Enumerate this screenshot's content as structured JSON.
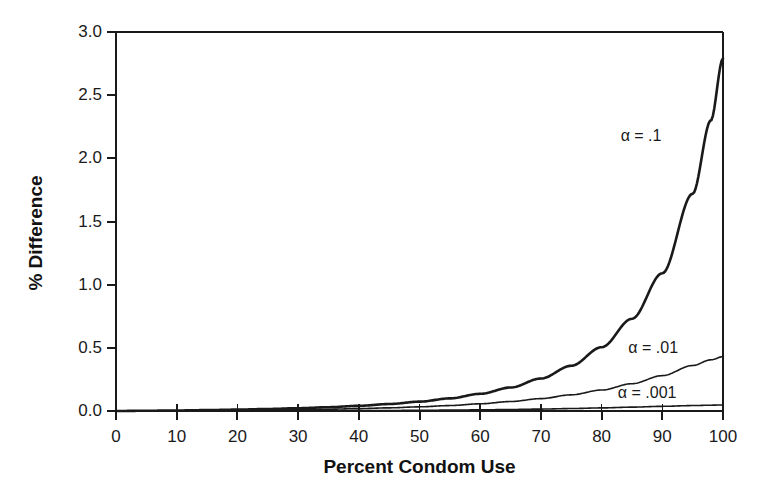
{
  "chart_data": {
    "type": "line",
    "title": "",
    "xlabel": "Percent Condom Use",
    "ylabel": "% Difference",
    "xlim": [
      0,
      100
    ],
    "ylim": [
      0,
      3.0
    ],
    "grid": false,
    "legend_position": "inline-annotations",
    "xticks": [
      "0",
      "10",
      "20",
      "30",
      "40",
      "50",
      "60",
      "70",
      "80",
      "90",
      "100"
    ],
    "xtick_values": [
      0,
      10,
      20,
      30,
      40,
      50,
      60,
      70,
      80,
      90,
      100
    ],
    "yticks": [
      "0.0",
      "0.5",
      "1.0",
      "1.5",
      "2.0",
      "2.5",
      "3.0"
    ],
    "ytick_values": [
      0.0,
      0.5,
      1.0,
      1.5,
      2.0,
      2.5,
      3.0
    ],
    "x": [
      0,
      5,
      10,
      15,
      20,
      25,
      30,
      35,
      40,
      45,
      50,
      55,
      60,
      65,
      70,
      75,
      80,
      85,
      90,
      95,
      98,
      100
    ],
    "series": [
      {
        "name": "alpha = .1",
        "annotation": "α = .1",
        "linewidth": 2.6,
        "color": "#1a1a1a",
        "values": [
          0.0,
          0.002,
          0.004,
          0.007,
          0.011,
          0.016,
          0.022,
          0.03,
          0.041,
          0.055,
          0.074,
          0.1,
          0.136,
          0.186,
          0.257,
          0.358,
          0.505,
          0.73,
          1.09,
          1.72,
          2.3,
          2.79
        ]
      },
      {
        "name": "alpha = .01",
        "annotation": "α = .01",
        "linewidth": 1.6,
        "color": "#1a1a1a",
        "values": [
          0.0,
          0.001,
          0.002,
          0.003,
          0.005,
          0.007,
          0.01,
          0.014,
          0.019,
          0.025,
          0.033,
          0.043,
          0.057,
          0.075,
          0.098,
          0.128,
          0.166,
          0.216,
          0.28,
          0.36,
          0.405,
          0.43
        ]
      },
      {
        "name": "alpha = .001",
        "annotation": "α = .001",
        "linewidth": 1.6,
        "color": "#1a1a1a",
        "values": [
          0.0,
          0.0001,
          0.0003,
          0.0005,
          0.0008,
          0.0012,
          0.0017,
          0.0023,
          0.0031,
          0.0041,
          0.0054,
          0.007,
          0.0091,
          0.0118,
          0.0152,
          0.0194,
          0.0245,
          0.0305,
          0.037,
          0.043,
          0.046,
          0.048
        ]
      }
    ],
    "annotations": [
      {
        "text": "α = .1",
        "x": 86.5,
        "y": 2.18
      },
      {
        "text": "α = .01",
        "x": 88.5,
        "y": 0.5
      },
      {
        "text": "α = .001",
        "x": 87.5,
        "y": 0.14
      }
    ]
  },
  "axes": {
    "ylabel": "% Difference",
    "xlabel": "Percent Condom Use",
    "ytick_labels": [
      "3.0",
      "2.5",
      "2.0",
      "1.5",
      "1.0",
      "0.5",
      "0.0"
    ],
    "xtick_labels": [
      "0",
      "10",
      "20",
      "30",
      "40",
      "50",
      "60",
      "70",
      "80",
      "90",
      "100"
    ]
  },
  "style": {
    "background": "#ffffff",
    "axis_color": "#1a1a1a",
    "line_color": "#1a1a1a"
  }
}
